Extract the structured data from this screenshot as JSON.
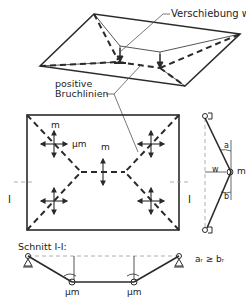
{
  "labels": {
    "displacement": "Verschiebung  w",
    "positive_1": "positive",
    "positive_2": "Bruchlinien",
    "m": "m",
    "mu_m": "µm",
    "section_title": "Schnitt I-I:",
    "section_mark_left": "I",
    "section_mark_right": "I",
    "w": "w",
    "a_r": "a",
    "b_r": "b",
    "r": "r",
    "inequality": "aᵣ ≥ bᵣ"
  },
  "colors": {
    "line": "#2a2a2a",
    "thin": "#555555",
    "dash_light": "#999999",
    "background": "#ffffff"
  }
}
